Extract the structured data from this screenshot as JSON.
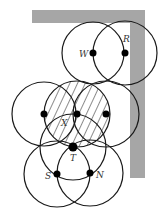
{
  "diagram": {
    "colors": {
      "band": "#a6a6a6",
      "stroke": "#1a1a1a",
      "dot": "#000000",
      "background": "#ffffff"
    },
    "band": {
      "top": {
        "x": 32,
        "y": 10,
        "w": 113,
        "h": 13
      },
      "right": {
        "x": 130,
        "y": 10,
        "w": 15,
        "h": 168
      }
    },
    "nodes": [
      {
        "id": "W",
        "label": "W",
        "x": 93,
        "y": 53,
        "r": 31
      },
      {
        "id": "R",
        "label": "R",
        "x": 125,
        "y": 53,
        "r": 32
      },
      {
        "id": "L",
        "label": "",
        "x": 44,
        "y": 114,
        "r": 32
      },
      {
        "id": "X",
        "label": "X",
        "x": 77,
        "y": 114,
        "r": 33
      },
      {
        "id": "E",
        "label": "",
        "x": 106,
        "y": 114,
        "r": 33
      },
      {
        "id": "T",
        "label": "T",
        "x": 73,
        "y": 147,
        "r": 33
      },
      {
        "id": "S",
        "label": "S",
        "x": 57,
        "y": 174,
        "r": 33
      },
      {
        "id": "N",
        "label": "N",
        "x": 90,
        "y": 173,
        "r": 33
      }
    ],
    "labels": {
      "W": "W",
      "R": "R",
      "X": "X",
      "T": "T",
      "S": "S",
      "N": "N"
    }
  }
}
